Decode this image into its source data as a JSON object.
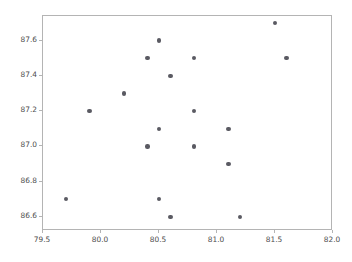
{
  "chart_data": {
    "type": "scatter",
    "title": "",
    "xlabel": "",
    "ylabel": "",
    "xlim": [
      79.5,
      82.0
    ],
    "ylim": [
      86.52,
      87.74
    ],
    "grid": false,
    "legend": null,
    "marker": {
      "shape": "circle",
      "color": "#5a5a62",
      "size": 4.4
    },
    "xticks": [
      "79.5",
      "80.0",
      "80.5",
      "81.0",
      "81.5",
      "82.0"
    ],
    "xtick_values": [
      79.5,
      80.0,
      80.5,
      81.0,
      81.5,
      82.0
    ],
    "yticks": [
      "86.6",
      "86.8",
      "87.0",
      "87.2",
      "87.4",
      "87.6"
    ],
    "ytick_values": [
      86.6,
      86.8,
      87.0,
      87.2,
      87.4,
      87.6
    ],
    "x": [
      81.5,
      80.5,
      80.4,
      80.8,
      81.6,
      80.6,
      80.2,
      79.9,
      80.8,
      80.5,
      81.1,
      80.4,
      80.8,
      81.1,
      79.7,
      80.5,
      80.6,
      81.2
    ],
    "y": [
      87.7,
      87.6,
      87.5,
      87.5,
      87.5,
      87.4,
      87.3,
      87.2,
      87.2,
      87.1,
      87.1,
      87.0,
      87.0,
      86.9,
      86.7,
      86.7,
      86.6,
      86.6
    ],
    "points": [
      {
        "x": 81.5,
        "y": 87.7
      },
      {
        "x": 80.5,
        "y": 87.6
      },
      {
        "x": 80.4,
        "y": 87.5
      },
      {
        "x": 80.8,
        "y": 87.5
      },
      {
        "x": 81.6,
        "y": 87.5
      },
      {
        "x": 80.6,
        "y": 87.4
      },
      {
        "x": 80.2,
        "y": 87.3
      },
      {
        "x": 79.9,
        "y": 87.2
      },
      {
        "x": 80.8,
        "y": 87.2
      },
      {
        "x": 80.5,
        "y": 87.1
      },
      {
        "x": 81.1,
        "y": 87.1
      },
      {
        "x": 80.4,
        "y": 87.0
      },
      {
        "x": 80.8,
        "y": 87.0
      },
      {
        "x": 81.1,
        "y": 86.9
      },
      {
        "x": 79.7,
        "y": 86.7
      },
      {
        "x": 80.5,
        "y": 86.7
      },
      {
        "x": 80.6,
        "y": 86.6
      },
      {
        "x": 81.2,
        "y": 86.6
      }
    ],
    "n_points": 18
  },
  "figure": {
    "background_color": "#ffffff",
    "axes_color": "#b4b4b4",
    "tick_label_color": "#4d4d4d"
  }
}
